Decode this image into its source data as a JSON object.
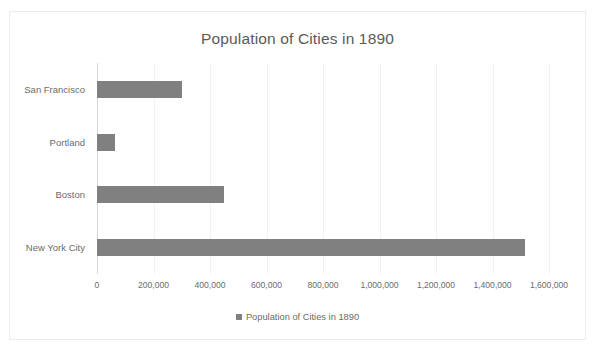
{
  "chart_data": {
    "type": "bar",
    "orientation": "horizontal",
    "title": "Population of Cities in 1890",
    "xlabel": "",
    "ylabel": "",
    "categories": [
      "San Francisco",
      "Portland",
      "Boston",
      "New York City"
    ],
    "values": [
      300000,
      63000,
      450000,
      1515000
    ],
    "series": [
      {
        "name": "Population of Cities in 1890",
        "values": [
          300000,
          63000,
          450000,
          1515000
        ]
      }
    ],
    "xlim": [
      0,
      1600000
    ],
    "xticks": [
      0,
      200000,
      400000,
      600000,
      800000,
      1000000,
      1200000,
      1400000,
      1600000
    ],
    "xtick_labels": [
      "0",
      "200,000",
      "400,000",
      "600,000",
      "800,000",
      "1,000,000",
      "1,200,000",
      "1,400,000",
      "1,600,000"
    ],
    "grid": true,
    "grid_axis": "x",
    "legend": {
      "visible": true,
      "position": "bottom",
      "entries": [
        {
          "label": "Population of Cities in 1890",
          "marker": "square",
          "color": "#808080"
        }
      ]
    },
    "colors": {
      "bar": "#808080",
      "title_text": "#5a5a5a",
      "tick_text": "#6b6b6b",
      "gridline": "#f2f2f2",
      "axis_line": "#d9d9d9",
      "plot_background": "#ffffff",
      "frame_border": "#eceded"
    }
  }
}
